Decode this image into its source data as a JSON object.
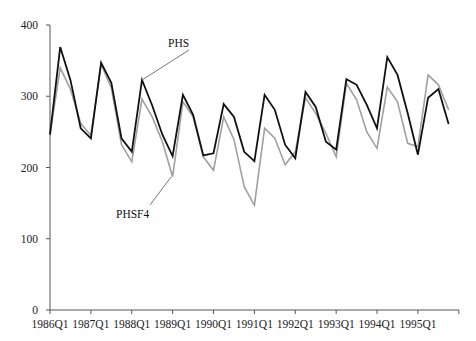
{
  "chart_data": {
    "type": "line",
    "title": "",
    "xlabel": "",
    "ylabel": "",
    "ylim": [
      0,
      400
    ],
    "yticks": [
      0,
      100,
      200,
      300,
      400
    ],
    "ytick_labels": [
      "0",
      "100",
      "200",
      "300",
      "400"
    ],
    "xtick_labels": [
      "1986Q1",
      "1987Q1",
      "1988Q1",
      "1989Q1",
      "1990Q1",
      "1991Q1",
      "1992Q1",
      "1993Q1",
      "1994Q1",
      "1995Q1"
    ],
    "grid": false,
    "legend": "none (inline annotations with pointer lines)",
    "x": [
      "1986Q1",
      "1986Q2",
      "1986Q3",
      "1986Q4",
      "1987Q1",
      "1987Q2",
      "1987Q3",
      "1987Q4",
      "1988Q1",
      "1988Q2",
      "1988Q3",
      "1988Q4",
      "1989Q1",
      "1989Q2",
      "1989Q3",
      "1989Q4",
      "1990Q1",
      "1990Q2",
      "1990Q3",
      "1990Q4",
      "1991Q1",
      "1991Q2",
      "1991Q3",
      "1991Q4",
      "1992Q1",
      "1992Q2",
      "1992Q3",
      "1992Q4",
      "1993Q1",
      "1993Q2",
      "1993Q3",
      "1993Q4",
      "1994Q1",
      "1994Q2",
      "1994Q3",
      "1994Q4",
      "1995Q1",
      "1995Q2",
      "1995Q3",
      "1995Q4"
    ],
    "series": [
      {
        "name": "PHS",
        "color": "#111111",
        "values": [
          246,
          369,
          323,
          255,
          241,
          347,
          319,
          241,
          222,
          323,
          287,
          246,
          216,
          302,
          274,
          217,
          220,
          289,
          271,
          222,
          209,
          302,
          281,
          232,
          213,
          306,
          285,
          236,
          225,
          324,
          316,
          288,
          255,
          355,
          330,
          276,
          218,
          298,
          310,
          261
        ]
      },
      {
        "name": "PHSF4",
        "color": "#a0a0a0",
        "values": [
          246,
          340,
          310,
          262,
          245,
          345,
          312,
          232,
          208,
          296,
          271,
          236,
          187,
          292,
          271,
          215,
          196,
          271,
          239,
          173,
          147,
          255,
          241,
          204,
          222,
          298,
          276,
          248,
          215,
          318,
          295,
          250,
          227,
          313,
          292,
          234,
          229,
          330,
          316,
          281
        ]
      }
    ],
    "annotations": [
      {
        "text": "PHS",
        "series": "PHS",
        "points_to": "1988Q2"
      },
      {
        "text": "PHSF4",
        "series": "PHSF4",
        "points_to": "1989Q1"
      }
    ]
  }
}
